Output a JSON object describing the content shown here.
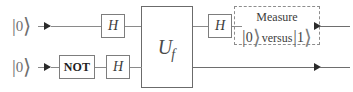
{
  "figure": {
    "width": 353,
    "height": 92,
    "background": "#ffffff",
    "line_color": "#8a8a8a",
    "box_border_color": "#7d7d7d",
    "text_color": "#3a3a3a"
  },
  "qubits": [
    {
      "id": "top",
      "input_label": {
        "bar": "|",
        "digit": "0",
        "angle": "⟩"
      }
    },
    {
      "id": "bottom",
      "input_label": {
        "bar": "|",
        "digit": "0",
        "angle": "⟩"
      }
    }
  ],
  "gates": {
    "hadamard_top_left": "H",
    "hadamard_top_right": "H",
    "not_bottom": "NOT",
    "hadamard_bottom": "H",
    "oracle": {
      "symbol": "U",
      "subscript": "f"
    }
  },
  "measurement": {
    "title": "Measure",
    "ket_zero": {
      "bar": "|",
      "digit": "0",
      "angle": "⟩"
    },
    "connector": "versus",
    "ket_one": {
      "bar": "|",
      "digit": "1",
      "angle": "⟩"
    },
    "border_style": "dashed",
    "border_color": "#8d8d8d"
  }
}
